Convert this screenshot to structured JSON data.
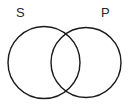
{
  "diagram": {
    "type": "venn",
    "title": "",
    "background_color": "#ffffff",
    "stroke_color": "#1a1a1a",
    "label_color": "#262626",
    "sets": [
      {
        "id": "S",
        "label": "S",
        "label_position": "top-left",
        "center_x": 44,
        "center_y": 62.5,
        "radius": 36,
        "fill": "none"
      },
      {
        "id": "P",
        "label": "P",
        "label_position": "top-right",
        "center_x": 86,
        "center_y": 62.5,
        "radius": 35,
        "fill": "none"
      }
    ],
    "intersection": {
      "label": "",
      "shaded": false
    }
  }
}
